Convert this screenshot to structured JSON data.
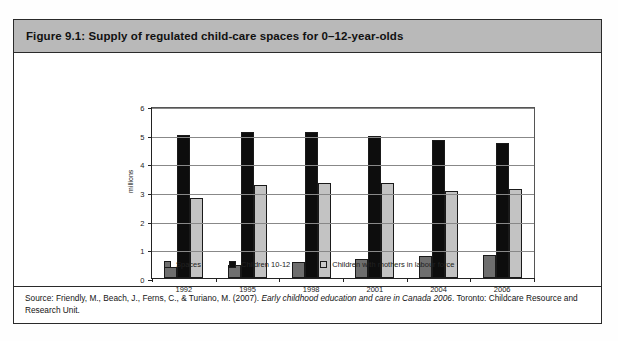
{
  "figure": {
    "title": "Figure 9.1: Supply of regulated child-care spaces for 0–12-year-olds",
    "source_prefix": "Source: Friendly, M., Beach, J., Ferns, C., & Turiano, M. (2007). ",
    "source_italic": "Early childhood education and care in Canada 2006",
    "source_suffix": ". Toronto:  Childcare Resource and Research Unit."
  },
  "colors": {
    "title_band": "#b9b9b9",
    "series_spaces": "#6e6e6e",
    "series_children": "#0d0d0d",
    "series_mothers": "#c3c3c3",
    "frame": "#2a2a2a"
  },
  "chart_data": {
    "type": "bar",
    "title": "Supply of regulated child-care spaces for 0–12-year-olds",
    "xlabel": "",
    "ylabel": "millions",
    "ylim": [
      0,
      6
    ],
    "yticks": [
      0,
      1,
      2,
      3,
      4,
      5,
      6
    ],
    "ytick_labels": [
      "0",
      "1",
      "2",
      "3",
      "4",
      "5",
      "6"
    ],
    "grid": true,
    "legend_position": "bottom",
    "categories": [
      "1992",
      "1995",
      "1998",
      "2001",
      "2004",
      "2006"
    ],
    "series": [
      {
        "name": "Spaces",
        "color": "#6e6e6e",
        "values": [
          0.4,
          0.47,
          0.55,
          0.65,
          0.78,
          0.82
        ]
      },
      {
        "name": "Children 10-12",
        "color": "#0d0d0d",
        "values": [
          5.0,
          5.1,
          5.1,
          4.95,
          4.8,
          4.7
        ]
      },
      {
        "name": "Children with mothers in labour force",
        "color": "#c3c3c3",
        "values": [
          2.8,
          3.25,
          3.3,
          3.3,
          3.05,
          3.1
        ]
      }
    ]
  }
}
